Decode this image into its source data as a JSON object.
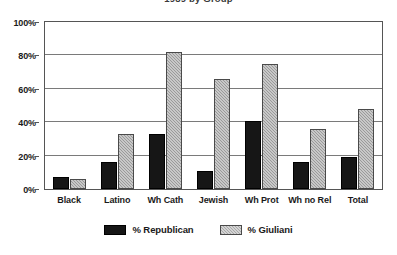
{
  "chart_data": {
    "type": "bar",
    "title": "1989 by Group",
    "xlabel": "",
    "ylabel": "",
    "ylim": [
      0,
      100
    ],
    "yticks": [
      0,
      20,
      40,
      60,
      80,
      100
    ],
    "ytick_labels": [
      "0%",
      "20%",
      "40%",
      "60%",
      "80%",
      "100%"
    ],
    "grid": true,
    "legend_position": "bottom-center",
    "categories": [
      "Black",
      "Latino",
      "Wh Cath",
      "Jewish",
      "Wh Prot",
      "Wh no Rel",
      "Total"
    ],
    "series": [
      {
        "name": "% Republican",
        "color": "#161616",
        "values": [
          7,
          16,
          33,
          11,
          41,
          16,
          19
        ]
      },
      {
        "name": "% Giuliani",
        "color": "#9a9a9a",
        "values": [
          6,
          33,
          82,
          66,
          75,
          36,
          48
        ]
      }
    ]
  },
  "legend": {
    "items": [
      {
        "label": "% Republican"
      },
      {
        "label": "% Giuliani"
      }
    ]
  }
}
